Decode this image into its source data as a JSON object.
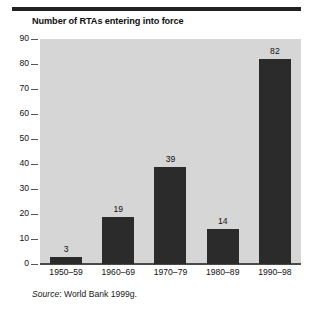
{
  "figure": {
    "title": "Number of RTAs entering into force",
    "source_label": "Source",
    "source_separator": ":",
    "source_text": "World Bank 1999g.",
    "background_color": "#ffffff",
    "plot_background_color": "#d6d6d6",
    "bar_color": "#2b2b2b",
    "rule_color": "#222222",
    "axis_color": "#4a4a4a"
  },
  "chart_data": {
    "type": "bar",
    "title": "Number of RTAs entering into force",
    "xlabel": "",
    "ylabel": "",
    "categories": [
      "1950–59",
      "1960–69",
      "1970–79",
      "1980–89",
      "1990–98"
    ],
    "values": [
      3,
      19,
      39,
      14,
      82
    ],
    "value_labels": [
      "3",
      "19",
      "39",
      "14",
      "82"
    ],
    "ylim": [
      0,
      90
    ],
    "yticks": [
      0,
      10,
      20,
      30,
      40,
      50,
      60,
      70,
      80,
      90
    ],
    "ytick_labels": [
      "0",
      "10",
      "20",
      "30",
      "40",
      "50",
      "60",
      "70",
      "80",
      "90"
    ],
    "grid": false,
    "legend": false,
    "legend_position": "none",
    "series": [
      {
        "name": "RTAs entering into force",
        "values": [
          3,
          19,
          39,
          14,
          82
        ]
      }
    ],
    "annotations": [
      "Source: World Bank 1999g."
    ]
  }
}
